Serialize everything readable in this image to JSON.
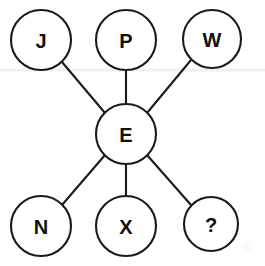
{
  "diagram": {
    "type": "node-link-graph",
    "background_color": "#ffffff",
    "stroke_color": "#1a1a1a",
    "label_color": "#111111",
    "canvas": {
      "width": 265,
      "height": 266
    },
    "center_node": {
      "id": "E",
      "label": "E",
      "cx": 126,
      "cy": 134,
      "r": 30
    },
    "outer_nodes": [
      {
        "id": "J",
        "label": "J",
        "cx": 41,
        "cy": 40,
        "r": 30,
        "position": "top-left"
      },
      {
        "id": "P",
        "label": "P",
        "cx": 126,
        "cy": 40,
        "r": 30,
        "position": "top-center"
      },
      {
        "id": "W",
        "label": "W",
        "cx": 212,
        "cy": 39,
        "r": 29,
        "position": "top-right"
      },
      {
        "id": "N",
        "label": "N",
        "cx": 41,
        "cy": 226,
        "r": 30,
        "position": "bottom-left"
      },
      {
        "id": "X",
        "label": "X",
        "cx": 126,
        "cy": 226,
        "r": 30,
        "position": "bottom-center"
      },
      {
        "id": "Q",
        "label": "?",
        "cx": 211,
        "cy": 224,
        "r": 27,
        "position": "bottom-right"
      }
    ],
    "edges": [
      {
        "from": "E",
        "to": "J",
        "kind": "diagonal"
      },
      {
        "from": "E",
        "to": "P",
        "kind": "vertical"
      },
      {
        "from": "E",
        "to": "W",
        "kind": "diagonal"
      },
      {
        "from": "E",
        "to": "N",
        "kind": "diagonal"
      },
      {
        "from": "E",
        "to": "X",
        "kind": "vertical"
      },
      {
        "from": "E",
        "to": "Q",
        "kind": "diagonal"
      }
    ],
    "artifacts": {
      "scan_line_y": 70,
      "scan_line_color": "#f1f1f1"
    }
  }
}
